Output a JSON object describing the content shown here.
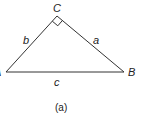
{
  "diagram": {
    "caption": "(a)",
    "vertices": {
      "A": {
        "label": "A",
        "x": 6,
        "y": 72
      },
      "B": {
        "label": "B",
        "x": 124,
        "y": 72
      },
      "C": {
        "label": "C",
        "x": 57,
        "y": 16
      }
    },
    "sides": {
      "a": {
        "label": "a",
        "from": "C",
        "to": "B"
      },
      "b": {
        "label": "b",
        "from": "A",
        "to": "C"
      },
      "c": {
        "label": "c",
        "from": "A",
        "to": "B"
      }
    },
    "right_angle_at": "C",
    "stroke_color": "#333333"
  }
}
